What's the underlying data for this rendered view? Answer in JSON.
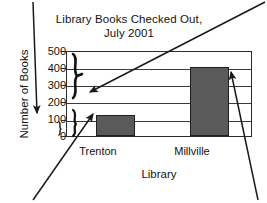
{
  "chart_data": {
    "type": "bar",
    "title": "Library Books Checked Out, July 2001",
    "title_line1": "Library Books Checked Out,",
    "title_line2": "July 2001",
    "xlabel": "Library",
    "ylabel": "Number of Books",
    "categories": [
      "Trenton",
      "Millville"
    ],
    "values": [
      125,
      400
    ],
    "ylim": [
      0,
      500
    ],
    "yticks": [
      500,
      400,
      300,
      200,
      100,
      0
    ],
    "ytick_labels": [
      "500",
      "400",
      "300",
      "200",
      "100",
      "0"
    ],
    "grid": true,
    "legend": "none",
    "bar_color": "#5a5a5a",
    "bar_edge_color": "#1f1f1f",
    "axis_color": "#2b2b2b",
    "background": "#ffffff"
  },
  "annotations": {
    "brace_left": "curly-brace",
    "brace_right": "curly-brace",
    "arrow_top_left": "down-arrow-to-y-axis",
    "arrow_into_plot": "arrow-pointing-to-axis-scale",
    "arrow_to_trenton_bar": "arrow-pointing-to-trenton-bar",
    "arrow_to_millville_bar": "arrow-pointing-to-millville-bar"
  }
}
